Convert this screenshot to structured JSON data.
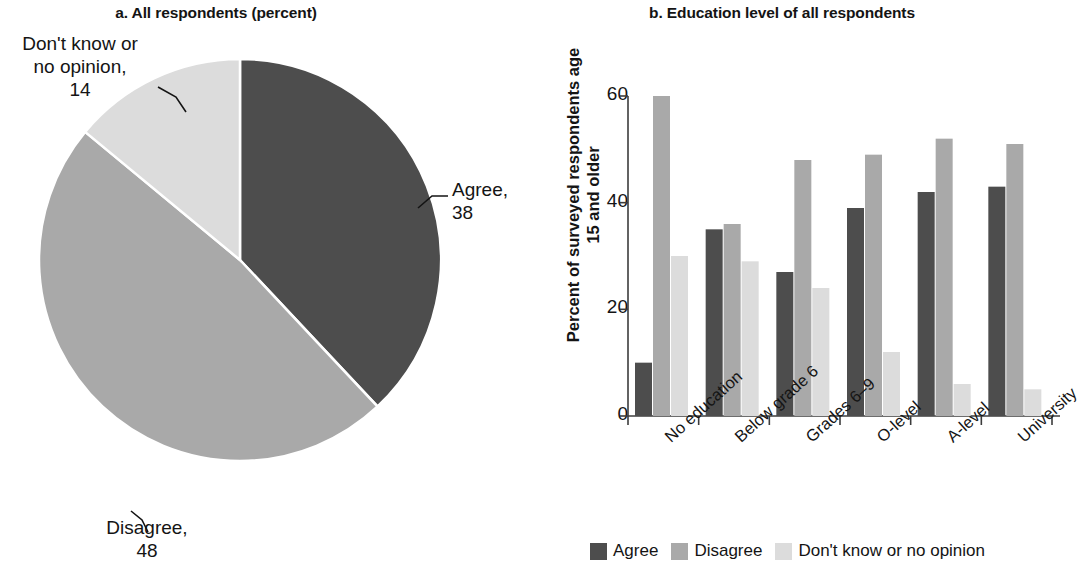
{
  "colors": {
    "agree": "#4d4d4d",
    "disagree": "#a9a9a9",
    "dontknow": "#dcdcdc",
    "axis": "#3c3c3c",
    "text": "#141414"
  },
  "panel_a": {
    "title": "a. All respondents (percent)",
    "labels": {
      "dontknow_line1": "Don't know or",
      "dontknow_line2": "no opinion,",
      "dontknow_value": "14",
      "agree_line1": "Agree,",
      "agree_value": "38",
      "disagree_line1": "Disagree,",
      "disagree_value": "48"
    }
  },
  "panel_b": {
    "title": "b. Education level of all respondents",
    "ylabel_line1": "Percent of surveyed respondents",
    "ylabel_line2": "age 15 and older",
    "legend": [
      {
        "label": "Agree",
        "color": "#4d4d4d"
      },
      {
        "label": "Disagree",
        "color": "#a9a9a9"
      },
      {
        "label": "Don't know or no opinion",
        "color": "#dcdcdc"
      }
    ]
  },
  "chart_data": [
    {
      "type": "pie",
      "title": "a. All respondents (percent)",
      "slices": [
        {
          "name": "Agree",
          "value": 38,
          "color": "#4d4d4d"
        },
        {
          "name": "Disagree",
          "value": 48,
          "color": "#a9a9a9"
        },
        {
          "name": "Don't know or no opinion",
          "value": 14,
          "color": "#dcdcdc"
        }
      ],
      "units": "percent",
      "start_angle_deg": 0,
      "direction": "clockwise",
      "legend": "labels with leader lines"
    },
    {
      "type": "bar",
      "title": "b. Education level of all respondents",
      "categories": [
        "No education",
        "Below grade 6",
        "Grades 6–9",
        "O-level",
        "A-level",
        "University"
      ],
      "series": [
        {
          "name": "Agree",
          "color": "#4d4d4d",
          "values": [
            10,
            35,
            27,
            39,
            42,
            43
          ]
        },
        {
          "name": "Disagree",
          "color": "#a9a9a9",
          "values": [
            60,
            36,
            48,
            49,
            52,
            51
          ]
        },
        {
          "name": "Don't know or no opinion",
          "color": "#dcdcdc",
          "values": [
            30,
            29,
            24,
            12,
            6,
            5
          ]
        }
      ],
      "xlabel": "",
      "ylabel": "Percent of surveyed respondents age 15 and older",
      "ylim": [
        0,
        60
      ],
      "yticks": [
        0,
        20,
        40,
        60
      ],
      "grid": false,
      "legend_position": "bottom"
    }
  ]
}
